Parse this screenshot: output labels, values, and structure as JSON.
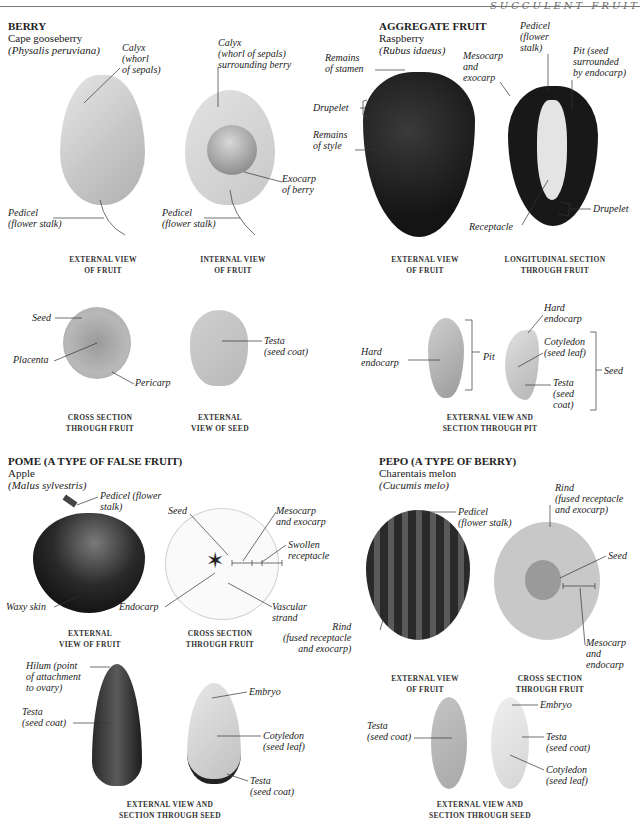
{
  "header": {
    "running_head": "SUCCULENT FRUIT"
  },
  "sections": {
    "berry": {
      "title": "BERRY",
      "common_name": "Cape gooseberry",
      "latin_name": "(Physalis peruviana)",
      "labels": {
        "calyx_ext": "Calyx\n(whorl\nof sepals)",
        "calyx_int": "Calyx\n(whorl of sepals)\nsurrounding berry",
        "pedicel_ext": "Pedicel\n(flower stalk)",
        "pedicel_int": "Pedicel\n(flower stalk)",
        "exocarp": "Exocarp\nof berry",
        "seed": "Seed",
        "placenta": "Placenta",
        "pericarp": "Pericarp",
        "testa": "Testa\n(seed coat)"
      },
      "captions": {
        "external": "EXTERNAL VIEW\nOF FRUIT",
        "internal": "INTERNAL VIEW\nOF FRUIT",
        "cross": "CROSS SECTION\nTHROUGH FRUIT",
        "seed": "EXTERNAL\nVIEW OF SEED"
      }
    },
    "aggregate": {
      "title": "AGGREGATE FRUIT",
      "common_name": "Raspberry",
      "latin_name": "(Rubus idaeus)",
      "labels": {
        "stamen": "Remains\nof stamen",
        "drupelet_left": "Drupelet",
        "style": "Remains\nof style",
        "mesocarp": "Mesocarp\nand\nexocarp",
        "pedicel": "Pedicel\n(flower\nstalk)",
        "pit": "Pit (seed\nsurrounded\nby endocarp)",
        "receptacle": "Receptacle",
        "drupelet_right": "Drupelet",
        "hard_endocarp_left": "Hard\nendocarp",
        "pit_bracket": "Pit",
        "hard_endocarp_right": "Hard\nendocarp",
        "cotyledon": "Cotyledon\n(seed leaf)",
        "testa": "Testa\n(seed\ncoat)",
        "seed_bracket": "Seed"
      },
      "captions": {
        "external": "EXTERNAL VIEW\nOF FRUIT",
        "longitudinal": "LONGITUDINAL SECTION\nTHROUGH FRUIT",
        "pit": "EXTERNAL VIEW AND\nSECTION THROUGH PIT"
      }
    },
    "pome": {
      "title": "POME (A TYPE OF FALSE FRUIT)",
      "common_name": "Apple",
      "latin_name": "(Malus sylvestris)",
      "labels": {
        "pedicel": "Pedicel (flower\nstalk)",
        "waxy": "Waxy skin",
        "seed": "Seed",
        "mesocarp": "Mesocarp\nand exocarp",
        "swollen": "Swollen\nreceptacle",
        "endocarp": "Endocarp",
        "vascular": "Vascular\nstrand",
        "hilum": "Hilum (point\nof attachment\nto ovary)",
        "testa_left": "Testa\n(seed coat)",
        "embryo": "Embryo",
        "cotyledon": "Cotyledon\n(seed leaf)",
        "testa_right": "Testa\n(seed coat)"
      },
      "captions": {
        "external": "EXTERNAL\nVIEW OF FRUIT",
        "cross": "CROSS SECTION\nTHROUGH FRUIT",
        "seed": "EXTERNAL VIEW AND\nSECTION THROUGH SEED"
      }
    },
    "pepo": {
      "title": "PEPO (A TYPE OF BERRY)",
      "common_name": "Charentais melon",
      "latin_name": "(Cucumis melo)",
      "labels": {
        "pedicel": "Pedicel\n(flower stalk)",
        "rind_top": "Rind\n(fused receptacle\nand exocarp)",
        "seed": "Seed",
        "rind_left": "Rind\n(fused receptacle\nand exocarp)",
        "mesocarp": "Mesocarp\nand\nendocarp",
        "testa_left": "Testa\n(seed coat)",
        "embryo": "Embryo",
        "testa_right": "Testa\n(seed coat)",
        "cotyledon": "Cotyledon\n(seed leaf)"
      },
      "captions": {
        "external": "EXTERNAL VIEW\nOF FRUIT",
        "cross": "CROSS SECTION\nTHROUGH FRUIT",
        "seed": "EXTERNAL VIEW AND\nSECTION THROUGH SEED"
      }
    }
  },
  "colors": {
    "text": "#222222",
    "rule": "#777777",
    "dark_fruit": "#1a1a1a",
    "pale_fruit": "#d8d8d8"
  }
}
